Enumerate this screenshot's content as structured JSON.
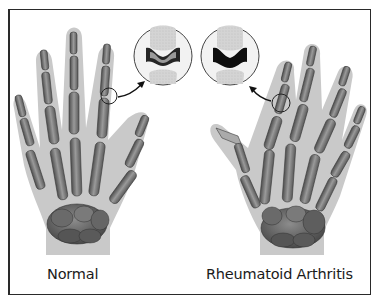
{
  "figure": {
    "labels": {
      "normal": "Normal",
      "rheumatoid": "Rheumatoid Arthritis"
    },
    "panels": [
      {
        "id": "normal",
        "label": "Normal",
        "inset": "healthy joint with intact cartilage space"
      },
      {
        "id": "rheumatoid",
        "label": "Rheumatoid Arthritis",
        "inset": "joint with eroded, narrowed cartilage space"
      }
    ],
    "colors": {
      "skin": "#c8c8c8",
      "bone_dark": "#5a5a5a",
      "bone_mid": "#8a8a8a",
      "bone_light": "#b5b5b5",
      "joint_gap": "#1c1c1c",
      "border": "#2a2a2a"
    }
  }
}
